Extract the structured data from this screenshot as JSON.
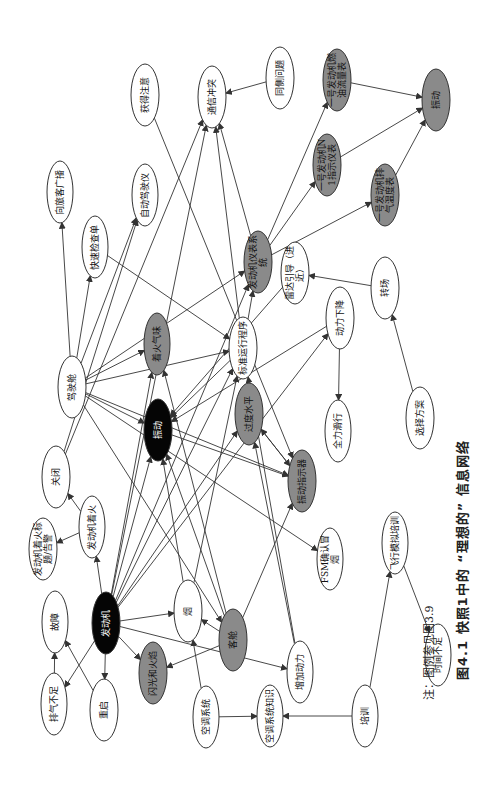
{
  "colors": {
    "black": "#050505",
    "gray": "#8a8a8a",
    "white": "#ffffff",
    "line": "#333333"
  },
  "caption": {
    "title": "图4.1   快照1中的 “理想的” 信息网络",
    "note": "注：图例参见图3.9"
  },
  "nodes": [
    {
      "id": "n1",
      "label": "获得注意",
      "x": 145,
      "y": 95,
      "rx": 14,
      "ry": 31,
      "fill": "white"
    },
    {
      "id": "n2",
      "label": "通信冲突",
      "x": 212,
      "y": 97,
      "rx": 14,
      "ry": 31,
      "fill": "white"
    },
    {
      "id": "n3",
      "label": "同侧问题",
      "x": 280,
      "y": 78,
      "rx": 14,
      "ry": 31,
      "fill": "white"
    },
    {
      "id": "n4",
      "label": "一号发动机燃油流量表",
      "x": 337,
      "y": 80,
      "rx": 14,
      "ry": 31,
      "fill": "gray"
    },
    {
      "id": "n5",
      "label": "一号发动机N1指示仪表",
      "x": 327,
      "y": 165,
      "rx": 14,
      "ry": 31,
      "fill": "gray"
    },
    {
      "id": "n6",
      "label": "一号发动机排气温度表",
      "x": 385,
      "y": 195,
      "rx": 14,
      "ry": 31,
      "fill": "gray"
    },
    {
      "id": "n7",
      "label": "振动",
      "x": 436,
      "y": 100,
      "rx": 14,
      "ry": 31,
      "fill": "gray"
    },
    {
      "id": "n8",
      "label": "向旅客广播",
      "x": 60,
      "y": 192,
      "rx": 13,
      "ry": 31,
      "fill": "white"
    },
    {
      "id": "n9",
      "label": "快速检查单",
      "x": 95,
      "y": 247,
      "rx": 13,
      "ry": 31,
      "fill": "white"
    },
    {
      "id": "n10",
      "label": "自动驾驶仪",
      "x": 145,
      "y": 195,
      "rx": 13,
      "ry": 31,
      "fill": "white"
    },
    {
      "id": "n11",
      "label": "发动机仪表系统",
      "x": 258,
      "y": 262,
      "rx": 14,
      "ry": 31,
      "fill": "gray"
    },
    {
      "id": "n12",
      "label": "雷达引导（进近）",
      "x": 295,
      "y": 273,
      "rx": 14,
      "ry": 31,
      "fill": "white"
    },
    {
      "id": "n13",
      "label": "转场",
      "x": 385,
      "y": 288,
      "rx": 14,
      "ry": 31,
      "fill": "white"
    },
    {
      "id": "n14",
      "label": "驾驶舱",
      "x": 72,
      "y": 387,
      "rx": 14,
      "ry": 31,
      "fill": "white"
    },
    {
      "id": "n15",
      "label": "着火气味",
      "x": 157,
      "y": 344,
      "rx": 13,
      "ry": 31,
      "fill": "gray"
    },
    {
      "id": "n16",
      "label": "标准运行程序",
      "x": 243,
      "y": 348,
      "rx": 14,
      "ry": 31,
      "fill": "white"
    },
    {
      "id": "n17",
      "label": "动力下降",
      "x": 340,
      "y": 318,
      "rx": 14,
      "ry": 31,
      "fill": "white"
    },
    {
      "id": "n18",
      "label": "选择方案",
      "x": 420,
      "y": 418,
      "rx": 14,
      "ry": 31,
      "fill": "white"
    },
    {
      "id": "n19",
      "label": "振动",
      "x": 158,
      "y": 430,
      "rx": 14,
      "ry": 31,
      "fill": "black"
    },
    {
      "id": "n20",
      "label": "过度水平",
      "x": 249,
      "y": 414,
      "rx": 14,
      "ry": 31,
      "fill": "gray"
    },
    {
      "id": "n21",
      "label": "关闭",
      "x": 56,
      "y": 477,
      "rx": 14,
      "ry": 31,
      "fill": "white"
    },
    {
      "id": "n22",
      "label": "全力滑行",
      "x": 338,
      "y": 431,
      "rx": 13,
      "ry": 31,
      "fill": "white"
    },
    {
      "id": "n23",
      "label": "发动机着火",
      "x": 92,
      "y": 527,
      "rx": 13,
      "ry": 31,
      "fill": "white"
    },
    {
      "id": "n24",
      "label": "发动机着火标题/告警",
      "x": 43,
      "y": 549,
      "rx": 14,
      "ry": 31,
      "fill": "white"
    },
    {
      "id": "n25",
      "label": "振动指示器",
      "x": 302,
      "y": 481,
      "rx": 14,
      "ry": 31,
      "fill": "gray"
    },
    {
      "id": "n26",
      "label": "FSM确认冒烟",
      "x": 330,
      "y": 559,
      "rx": 13,
      "ry": 31,
      "fill": "white"
    },
    {
      "id": "n27",
      "label": "飞行模拟培训",
      "x": 395,
      "y": 543,
      "rx": 13,
      "ry": 31,
      "fill": "white"
    },
    {
      "id": "n28",
      "label": "故障",
      "x": 55,
      "y": 622,
      "rx": 13,
      "ry": 31,
      "fill": "white"
    },
    {
      "id": "n29",
      "label": "发动机",
      "x": 106,
      "y": 623,
      "rx": 14,
      "ry": 31,
      "fill": "black"
    },
    {
      "id": "n30",
      "label": "烟",
      "x": 188,
      "y": 611,
      "rx": 14,
      "ry": 31,
      "fill": "white"
    },
    {
      "id": "n31",
      "label": "客舱",
      "x": 233,
      "y": 640,
      "rx": 14,
      "ry": 31,
      "fill": "gray"
    },
    {
      "id": "n32",
      "label": "排气不足",
      "x": 54,
      "y": 704,
      "rx": 13,
      "ry": 31,
      "fill": "white"
    },
    {
      "id": "n33",
      "label": "重启",
      "x": 104,
      "y": 710,
      "rx": 14,
      "ry": 31,
      "fill": "white"
    },
    {
      "id": "n34",
      "label": "闪光和火焰",
      "x": 153,
      "y": 673,
      "rx": 14,
      "ry": 31,
      "fill": "gray"
    },
    {
      "id": "n35",
      "label": "空调系统",
      "x": 206,
      "y": 717,
      "rx": 13,
      "ry": 31,
      "fill": "white"
    },
    {
      "id": "n36",
      "label": "增加动力",
      "x": 300,
      "y": 672,
      "rx": 13,
      "ry": 31,
      "fill": "white"
    },
    {
      "id": "n37",
      "label": "空调系统知识",
      "x": 270,
      "y": 716,
      "rx": 13,
      "ry": 31,
      "fill": "white"
    },
    {
      "id": "n38",
      "label": "培训",
      "x": 365,
      "y": 716,
      "rx": 13,
      "ry": 31,
      "fill": "white"
    },
    {
      "id": "n39",
      "label": "时间不足",
      "x": 438,
      "y": 655,
      "rx": 13,
      "ry": 31,
      "fill": "white"
    }
  ],
  "edges": [
    [
      "n14",
      "n8"
    ],
    [
      "n14",
      "n9"
    ],
    [
      "n14",
      "n10"
    ],
    [
      "n14",
      "n11"
    ],
    [
      "n14",
      "n15"
    ],
    [
      "n14",
      "n16"
    ],
    [
      "n14",
      "n19"
    ],
    [
      "n14",
      "n25"
    ],
    [
      "n14",
      "n26"
    ],
    [
      "n14",
      "n31"
    ],
    [
      "n9",
      "n16"
    ],
    [
      "n1",
      "n25"
    ],
    [
      "n21",
      "n2"
    ],
    [
      "n21",
      "n10"
    ],
    [
      "n11",
      "n4"
    ],
    [
      "n11",
      "n5"
    ],
    [
      "n11",
      "n6"
    ],
    [
      "n11",
      "n2"
    ],
    [
      "n3",
      "n2"
    ],
    [
      "n4",
      "n7"
    ],
    [
      "n5",
      "n7"
    ],
    [
      "n6",
      "n7"
    ],
    [
      "n13",
      "n12"
    ],
    [
      "n18",
      "n13"
    ],
    [
      "n16",
      "n2"
    ],
    [
      "n16",
      "n19"
    ],
    [
      "n16",
      "n11"
    ],
    [
      "n17",
      "n22"
    ],
    [
      "n17",
      "n19"
    ],
    [
      "n20",
      "n25"
    ],
    [
      "n25",
      "n20"
    ],
    [
      "n19",
      "n25"
    ],
    [
      "n23",
      "n21"
    ],
    [
      "n23",
      "n24"
    ],
    [
      "n29",
      "n23"
    ],
    [
      "n29",
      "n19"
    ],
    [
      "n29",
      "n30"
    ],
    [
      "n29",
      "n34"
    ],
    [
      "n29",
      "n33"
    ],
    [
      "n29",
      "n32"
    ],
    [
      "n29",
      "n36"
    ],
    [
      "n29",
      "n15"
    ],
    [
      "n29",
      "n16"
    ],
    [
      "n29",
      "n11"
    ],
    [
      "n29",
      "n17"
    ],
    [
      "n29",
      "n2"
    ],
    [
      "n29",
      "n20"
    ],
    [
      "n32",
      "n28"
    ],
    [
      "n33",
      "n28"
    ],
    [
      "n31",
      "n30"
    ],
    [
      "n31",
      "n34"
    ],
    [
      "n31",
      "n19"
    ],
    [
      "n31",
      "n25"
    ],
    [
      "n31",
      "n15"
    ],
    [
      "n30",
      "n19"
    ],
    [
      "n30",
      "n16"
    ],
    [
      "n35",
      "n30"
    ],
    [
      "n35",
      "n37"
    ],
    [
      "n38",
      "n37"
    ],
    [
      "n38",
      "n27"
    ],
    [
      "n27",
      "n39"
    ],
    [
      "n36",
      "n20"
    ],
    [
      "n36",
      "n16"
    ],
    [
      "n12",
      "n19"
    ]
  ]
}
